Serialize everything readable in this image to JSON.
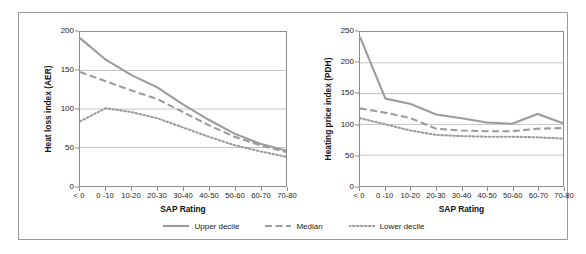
{
  "figure": {
    "bleed_text": "........",
    "border_color": "#9a9a9a",
    "background": "#ffffff"
  },
  "legend": {
    "position": "bottom-center",
    "items": [
      {
        "label": "Upper decile",
        "style": "solid",
        "icon": "line-solid-swatch",
        "color": "#9b9b9b"
      },
      {
        "label": "Median",
        "style": "dashed",
        "icon": "line-dashed-swatch",
        "color": "#9b9b9b"
      },
      {
        "label": "Lower decile",
        "style": "dotted",
        "icon": "line-dotted-swatch",
        "color": "#9b9b9b"
      }
    ]
  },
  "chart_data": [
    {
      "type": "line",
      "title": "",
      "xlabel": "SAP Rating",
      "ylabel": "Heat loss index (AER)",
      "categories": [
        "< 0",
        "0 -10",
        "10-20",
        "20-30",
        "30-40",
        "40-50",
        "50-60",
        "60-70",
        "70-80"
      ],
      "ytick_labels": [
        "0",
        "50",
        "100",
        "150",
        "200"
      ],
      "ylim": [
        0,
        200
      ],
      "ytick_step": 50,
      "grid": "horizontal",
      "series": [
        {
          "name": "Upper decile",
          "style": "solid",
          "values": [
            192,
            164,
            144,
            128,
            106,
            86,
            68,
            55,
            46
          ]
        },
        {
          "name": "Median",
          "style": "dashed",
          "values": [
            148,
            136,
            124,
            113,
            96,
            79,
            64,
            53,
            44
          ]
        },
        {
          "name": "Lower decile",
          "style": "dotted",
          "values": [
            84,
            101,
            96,
            88,
            76,
            64,
            53,
            45,
            38
          ]
        }
      ]
    },
    {
      "type": "line",
      "title": "",
      "xlabel": "SAP Rating",
      "ylabel": "Heating price index (PDH)",
      "categories": [
        "< 0",
        "0 -10",
        "10-20",
        "20-30",
        "30-40",
        "40-50",
        "50-60",
        "60-70",
        "70-80"
      ],
      "ytick_labels": [
        "0",
        "50",
        "100",
        "150",
        "200",
        "250"
      ],
      "ylim": [
        0,
        250
      ],
      "ytick_step": 50,
      "grid": "horizontal",
      "series": [
        {
          "name": "Upper decile",
          "style": "solid",
          "values": [
            242,
            142,
            133,
            116,
            110,
            103,
            101,
            117,
            102
          ]
        },
        {
          "name": "Median",
          "style": "dashed",
          "values": [
            126,
            119,
            110,
            93,
            90,
            89,
            89,
            93,
            94
          ]
        },
        {
          "name": "Lower decile",
          "style": "dotted",
          "values": [
            110,
            100,
            90,
            83,
            81,
            80,
            80,
            79,
            77
          ]
        }
      ]
    }
  ]
}
